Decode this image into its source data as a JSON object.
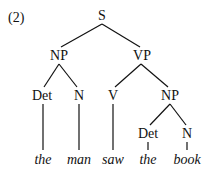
{
  "example_number": "(2)",
  "tree": {
    "nodes": [
      {
        "id": "S",
        "label": "S",
        "x": 102,
        "y": 9
      },
      {
        "id": "NP1",
        "label": "NP",
        "x": 59,
        "y": 49
      },
      {
        "id": "VP",
        "label": "VP",
        "x": 142,
        "y": 49
      },
      {
        "id": "Det1",
        "label": "Det",
        "x": 42,
        "y": 89
      },
      {
        "id": "N1",
        "label": "N",
        "x": 79,
        "y": 89
      },
      {
        "id": "V",
        "label": "V",
        "x": 113,
        "y": 89
      },
      {
        "id": "NP2",
        "label": "NP",
        "x": 170,
        "y": 89
      },
      {
        "id": "Det2",
        "label": "Det",
        "x": 148,
        "y": 127
      },
      {
        "id": "N2",
        "label": "N",
        "x": 187,
        "y": 127
      }
    ],
    "words": [
      {
        "label": "the",
        "x": 43,
        "y": 153
      },
      {
        "label": "man",
        "x": 79,
        "y": 153
      },
      {
        "label": "saw",
        "x": 113,
        "y": 153
      },
      {
        "label": "the",
        "x": 148,
        "y": 153
      },
      {
        "label": "book",
        "x": 187,
        "y": 153
      }
    ]
  }
}
